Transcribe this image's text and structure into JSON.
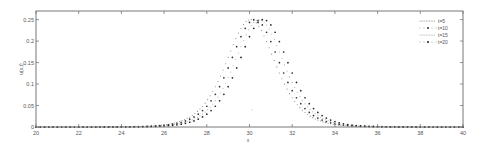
{
  "chart_data": {
    "type": "scatter",
    "title": "",
    "xlabel": "x",
    "ylabel": "u(x,t)",
    "xlim": [
      20,
      40
    ],
    "ylim": [
      0,
      0.27
    ],
    "xticks": [
      20,
      22,
      24,
      26,
      28,
      30,
      32,
      34,
      36,
      38,
      40
    ],
    "yticks": [
      0,
      0.05,
      0.1,
      0.15,
      0.2,
      0.25
    ],
    "ytick_labels": [
      "0",
      "0.05",
      "0.1",
      "0.15",
      "0.2",
      "0.25"
    ],
    "grid": false,
    "legend_position": "upper right",
    "model": "u = 0.25 * sech^2(0.65 * (x - center))",
    "x": [
      20,
      20.5,
      21,
      21.5,
      22,
      22.5,
      23,
      23.5,
      24,
      24.5,
      25,
      25.5,
      26,
      26.5,
      27,
      27.5,
      28,
      28.25,
      28.5,
      28.75,
      29,
      29.25,
      29.5,
      29.75,
      30,
      30.25,
      30.5,
      30.75,
      31,
      31.25,
      31.5,
      31.75,
      32,
      32.25,
      32.5,
      32.75,
      33,
      33.5,
      34,
      34.5,
      35,
      35.5,
      36,
      36.5,
      37,
      37.5,
      38,
      38.5,
      39,
      39.5,
      40
    ],
    "series": [
      {
        "name": "t=5",
        "center": 30.05,
        "style": "dotted",
        "color": "#888888",
        "peak": 0.25
      },
      {
        "name": "t=10",
        "center": 30.25,
        "style": "dot-marker",
        "color": "#333333",
        "peak": 0.25
      },
      {
        "name": "t=15",
        "center": 30.45,
        "style": "dotted",
        "color": "#aaaaaa",
        "peak": 0.25
      },
      {
        "name": "t=20",
        "center": 30.65,
        "style": "dot-marker",
        "color": "#222222",
        "peak": 0.25
      }
    ]
  }
}
